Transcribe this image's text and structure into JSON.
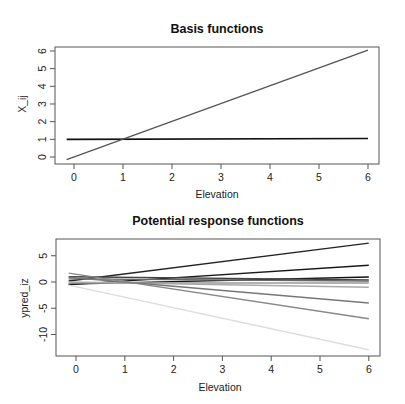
{
  "chart_data": [
    {
      "type": "line",
      "title": "Basis functions",
      "xlabel": "Elevation",
      "ylabel": "X_ij",
      "xlim": [
        -0.15,
        6
      ],
      "ylim": [
        -0.15,
        6.05
      ],
      "xticks": [
        "0",
        "1",
        "2",
        "3",
        "4",
        "5",
        "6"
      ],
      "yticks": [
        "0",
        "1",
        "2",
        "3",
        "4",
        "5",
        "6"
      ],
      "grid": false,
      "legend": null,
      "series": [
        {
          "name": "intercept",
          "color": "#111111",
          "x": [
            -0.15,
            6
          ],
          "y": [
            1.0,
            1.05
          ]
        },
        {
          "name": "elevation",
          "color": "#555555",
          "x": [
            -0.15,
            6
          ],
          "y": [
            -0.15,
            6.05
          ]
        }
      ]
    },
    {
      "type": "line",
      "title": "Potential response functions",
      "xlabel": "Elevation",
      "ylabel": "ypred_iz",
      "xlim": [
        -0.15,
        6
      ],
      "ylim": [
        -13,
        7.5
      ],
      "xticks": [
        "0",
        "1",
        "2",
        "3",
        "4",
        "5",
        "6"
      ],
      "yticks": [
        "-10",
        "-5",
        "0",
        "5"
      ],
      "grid": false,
      "legend": null,
      "series": [
        {
          "name": "z1",
          "color": "#222222",
          "x": [
            -0.15,
            6
          ],
          "y": [
            0.2,
            7.4
          ]
        },
        {
          "name": "z2",
          "color": "#1a1a1a",
          "x": [
            -0.15,
            6
          ],
          "y": [
            -0.5,
            3.2
          ]
        },
        {
          "name": "z3",
          "color": "#111111",
          "x": [
            -0.15,
            6
          ],
          "y": [
            -0.4,
            0.95
          ]
        },
        {
          "name": "z4",
          "color": "#444444",
          "x": [
            -0.15,
            6
          ],
          "y": [
            1.0,
            0.4
          ]
        },
        {
          "name": "z5",
          "color": "#666666",
          "x": [
            -0.15,
            6
          ],
          "y": [
            0.6,
            0.2
          ]
        },
        {
          "name": "z6",
          "color": "#999999",
          "x": [
            -0.15,
            6
          ],
          "y": [
            -0.2,
            -0.2
          ]
        },
        {
          "name": "z7",
          "color": "#aaaaaa",
          "x": [
            -0.15,
            6
          ],
          "y": [
            0.0,
            -1.0
          ]
        },
        {
          "name": "z8",
          "color": "#777777",
          "x": [
            -0.15,
            6
          ],
          "y": [
            0.9,
            -4.0
          ]
        },
        {
          "name": "z9",
          "color": "#888888",
          "x": [
            -0.15,
            6
          ],
          "y": [
            1.7,
            -7.0
          ]
        },
        {
          "name": "z10",
          "color": "#dddddd",
          "x": [
            -0.15,
            6
          ],
          "y": [
            -0.6,
            -12.9
          ]
        }
      ]
    }
  ],
  "charts": [
    {
      "title": "Basis functions",
      "xlabel": "Elevation",
      "ylabel": "X_ij"
    },
    {
      "title": "Potential response functions",
      "xlabel": "Elevation",
      "ylabel": "ypred_iz"
    }
  ]
}
